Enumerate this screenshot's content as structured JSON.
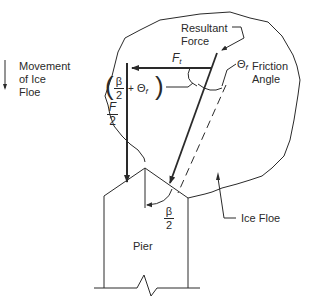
{
  "diagram": {
    "type": "force-diagram",
    "legend": {
      "movement_label_line1": "Movement",
      "movement_label_line2": "of Ice",
      "movement_label_line3": "Floe",
      "movement_arrow_icon": "down-arrow"
    },
    "labels": {
      "resultant_line1": "Resultant",
      "resultant_line2": "Force",
      "ft_symbol": "F",
      "ft_subscript": "t",
      "theta_symbol": "Θ",
      "theta_subscript": "f",
      "friction_line1": "Friction",
      "friction_line2": "Angle",
      "combined_angle_beta": "β",
      "combined_angle_den": "2",
      "combined_angle_plus": "+",
      "combined_angle_theta": "Θ",
      "combined_angle_sub": "f",
      "f_over_2_num": "F",
      "f_over_2_den": "2",
      "beta_over_2_num": "β",
      "beta_over_2_den": "2",
      "pier": "Pier",
      "ice_floe": "Ice Floe"
    },
    "colors": {
      "line": "#2a2a2a",
      "background": "#ffffff"
    }
  }
}
